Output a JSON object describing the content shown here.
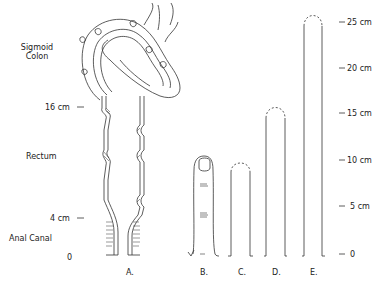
{
  "figure": {
    "left_labels": {
      "sigmoid_line1": "Sigmoid",
      "sigmoid_line2": "Colon",
      "mark_16": "16 cm",
      "rectum": "Rectum",
      "mark_4": "4 cm",
      "anal_canal": "Anal Canal",
      "mark_0": "0"
    },
    "panels": [
      {
        "id": "A",
        "label": "A.",
        "depicts": "sigmoid colon, rectum and anal canal (cross-section)"
      },
      {
        "id": "B",
        "label": "B.",
        "depicts": "finger"
      },
      {
        "id": "C",
        "label": "C.",
        "depicts": "instrument ~10 cm"
      },
      {
        "id": "D",
        "label": "D.",
        "depicts": "instrument ~15 cm"
      },
      {
        "id": "E",
        "label": "E.",
        "depicts": "instrument ~25 cm"
      }
    ],
    "scale": {
      "ticks": [
        "25 cm",
        "20 cm",
        "15 cm",
        "10 cm",
        "5 cm",
        "0"
      ],
      "values_cm": [
        25,
        20,
        15,
        10,
        5,
        0
      ]
    },
    "colors": {
      "line": "#333333",
      "background": "#ffffff"
    }
  }
}
